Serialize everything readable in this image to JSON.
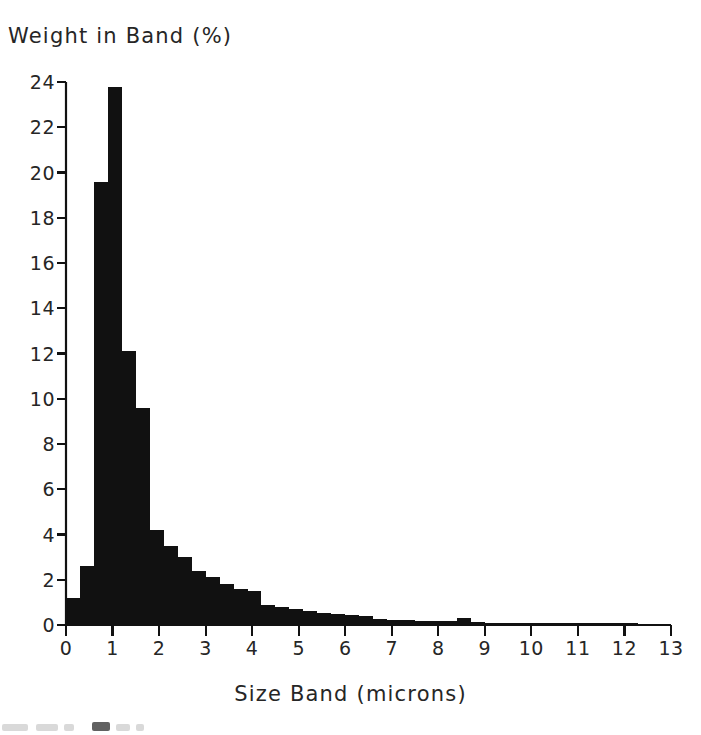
{
  "chart_data": {
    "type": "bar",
    "title": "",
    "xlabel": "Size Band (microns)",
    "ylabel": "Weight in Band (%)",
    "xlim": [
      0,
      13
    ],
    "ylim": [
      0,
      24
    ],
    "xticks": [
      0,
      1,
      2,
      3,
      4,
      5,
      6,
      7,
      8,
      9,
      10,
      11,
      12,
      13
    ],
    "ytick_labels": [
      "0",
      "2",
      "4",
      "6",
      "8",
      "10",
      "12",
      "14",
      "16",
      "18",
      "20",
      "22",
      "24"
    ],
    "xtick_labels": [
      "0",
      "1",
      "2",
      "3",
      "4",
      "5",
      "6",
      "7",
      "8",
      "9",
      "10",
      "11",
      "12",
      "13"
    ],
    "yticks": [
      0,
      2,
      4,
      6,
      8,
      10,
      12,
      14,
      16,
      18,
      20,
      22,
      24
    ],
    "grid": false,
    "legend": "none",
    "bar_color": "#111111",
    "axis_color": "#111111",
    "bin_width": 0.3,
    "bin_starts": [
      0.0,
      0.3,
      0.6,
      0.9,
      1.2,
      1.5,
      1.8,
      2.1,
      2.4,
      2.7,
      3.0,
      3.3,
      3.6,
      3.9,
      4.2,
      4.5,
      4.8,
      5.1,
      5.4,
      5.7,
      6.0,
      6.3,
      6.6,
      6.9,
      7.2,
      7.5,
      7.8,
      8.1,
      8.4,
      8.7,
      9.0,
      9.3,
      9.6,
      9.9,
      10.2,
      10.5,
      10.8,
      11.1,
      11.4,
      11.7,
      12.0
    ],
    "categories": [
      "0.0-0.3",
      "0.3-0.6",
      "0.6-0.9",
      "0.9-1.2",
      "1.2-1.5",
      "1.5-1.8",
      "1.8-2.1",
      "2.1-2.4",
      "2.4-2.7",
      "2.7-3.0",
      "3.0-3.3",
      "3.3-3.6",
      "3.6-3.9",
      "3.9-4.2",
      "4.2-4.5",
      "4.5-4.8",
      "4.8-5.1",
      "5.1-5.4",
      "5.4-5.7",
      "5.7-6.0",
      "6.0-6.3",
      "6.3-6.6",
      "6.6-6.9",
      "6.9-7.2",
      "7.2-7.5",
      "7.5-7.8",
      "7.8-8.1",
      "8.1-8.4",
      "8.4-8.7",
      "8.7-9.0",
      "9.0-9.3",
      "9.3-9.6",
      "9.6-9.9",
      "9.9-10.2",
      "10.2-10.5",
      "10.5-10.8",
      "10.8-11.1",
      "11.1-11.4",
      "11.4-11.7",
      "11.7-12.0",
      "12.0-12.3"
    ],
    "values": [
      1.2,
      2.6,
      19.6,
      23.8,
      12.1,
      9.6,
      4.2,
      3.5,
      3.0,
      2.4,
      2.1,
      1.8,
      1.6,
      1.5,
      0.9,
      0.8,
      0.7,
      0.6,
      0.55,
      0.5,
      0.45,
      0.4,
      0.25,
      0.2,
      0.2,
      0.18,
      0.16,
      0.16,
      0.3,
      0.14,
      0.1,
      0.1,
      0.1,
      0.1,
      0.1,
      0.1,
      0.1,
      0.1,
      0.1,
      0.1,
      0.08
    ],
    "peak_value": 23.8,
    "peak_bin": "0.9-1.2"
  }
}
